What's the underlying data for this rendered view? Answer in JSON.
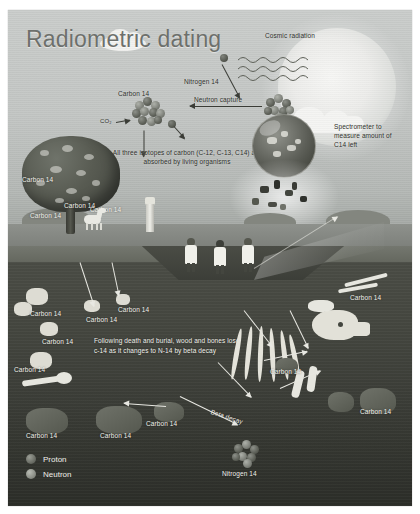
{
  "poster": {
    "title": "Radiometric dating"
  },
  "sky": {
    "cosmic_label": "Cosmic radiation",
    "nitrogen_label": "Nitrogen 14",
    "neutron_capture_label": "Neutron capture",
    "carbon14_top_label": "Carbon 14",
    "co2_label": "CO₂",
    "spectrometer_note": "Spectrometer to measure amount of C14 left",
    "isotope_note": "All three isotopes of carbon (C-12, C-13, C14) are absorbed by living organisms"
  },
  "tree_labels": [
    "Carbon 14",
    "Carbon 14",
    "Carbon 14",
    "Carbon 14"
  ],
  "underground": {
    "decay_note": "Following death and burial, wood and bones lose c-14 as it changes to N-14 by beta decay",
    "beta_decay_label": "Beta decay",
    "nitrogen_label": "Nitrogen 14",
    "carbon_labels": [
      "Carbon 14",
      "Carbon 14",
      "Carbon 14",
      "Carbon 14",
      "Carbon 14",
      "Carbon 14",
      "Carbon 14",
      "Carbon 14",
      "Carbon 14",
      "Carbon 14"
    ]
  },
  "legend": {
    "items": [
      {
        "label": "Proton",
        "color": "#6b6e66"
      },
      {
        "label": "Neutron",
        "color": "#8b8e86"
      }
    ]
  },
  "colors": {
    "sky": "#c5c8c6",
    "soil": "#44463f",
    "label_text": "#f2f2ec",
    "title_text": "#6d706c"
  }
}
